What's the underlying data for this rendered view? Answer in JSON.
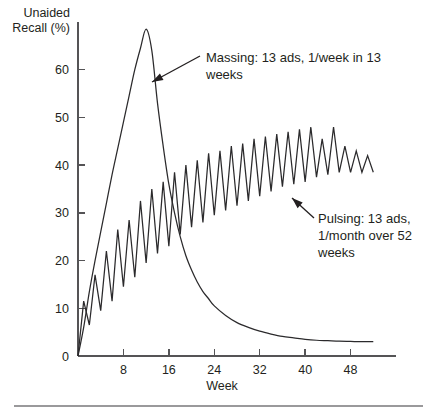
{
  "chart_data": {
    "type": "line",
    "title": "",
    "xlabel": "Week",
    "ylabel": "Unaided Recall (%)",
    "xlim": [
      0,
      56
    ],
    "ylim": [
      0,
      70
    ],
    "xticks": [
      0,
      8,
      16,
      24,
      32,
      40,
      48
    ],
    "xtick_labels": [
      "0",
      "8",
      "16",
      "24",
      "32",
      "40",
      "48"
    ],
    "yticks": [
      0,
      10,
      20,
      30,
      40,
      50,
      60
    ],
    "ytick_labels": [
      "0",
      "10",
      "20",
      "30",
      "40",
      "50",
      "60"
    ],
    "grid": false,
    "legend": "none",
    "series": [
      {
        "name": "Massing: 13 ads, 1/week in 13 weeks",
        "x": [
          0,
          1,
          2,
          3,
          4,
          5,
          6,
          7,
          8,
          9,
          10,
          11,
          12,
          13,
          14,
          15,
          16,
          17,
          18,
          19,
          20,
          21,
          22,
          23,
          24,
          26,
          28,
          30,
          32,
          34,
          36,
          38,
          40,
          42,
          44,
          46,
          48,
          50,
          52
        ],
        "y": [
          0,
          6,
          13.5,
          20,
          26,
          32,
          38,
          43.5,
          49,
          54.5,
          60,
          64.5,
          68.5,
          64,
          53,
          44,
          36,
          30,
          25,
          21,
          18,
          15.5,
          13.5,
          12,
          10.5,
          8.5,
          7,
          6,
          5.2,
          4.6,
          4.1,
          3.8,
          3.5,
          3.3,
          3.2,
          3.1,
          3.05,
          3.0,
          3.0
        ]
      },
      {
        "name": "Pulsing: 13 ads, 1/month over 52 weeks",
        "x": [
          0,
          1,
          2,
          3,
          4,
          5,
          6,
          7,
          8,
          9,
          10,
          11,
          12,
          13,
          14,
          15,
          16,
          17,
          18,
          19,
          20,
          21,
          22,
          23,
          24,
          25,
          26,
          27,
          28,
          29,
          30,
          31,
          32,
          33,
          34,
          35,
          36,
          37,
          38,
          39,
          40,
          41,
          42,
          43,
          44,
          45,
          46,
          47,
          48,
          49,
          50,
          51,
          52
        ],
        "y": [
          0,
          11.5,
          6.5,
          17,
          9.5,
          22,
          11.5,
          26.5,
          14.5,
          28.5,
          16.5,
          32.5,
          19.5,
          35,
          21.5,
          36.5,
          23,
          38.5,
          25.5,
          40,
          27,
          41,
          28,
          42.5,
          29.5,
          43,
          30.5,
          44,
          31.5,
          44.5,
          32.5,
          45.5,
          33.5,
          46,
          34.5,
          46.5,
          35.5,
          47,
          36,
          47.5,
          36.5,
          48,
          37.5,
          45.5,
          38,
          48,
          38.5,
          44,
          38.5,
          43,
          38.5,
          42,
          38.5
        ]
      }
    ],
    "annotations": [
      {
        "id": "massing",
        "text_lines": [
          "Massing: 13 ads, 1/week in 13",
          "weeks"
        ],
        "text_x": 206,
        "text_y": 62,
        "leader_from": [
          200,
          56
        ],
        "leader_to": [
          152,
          82
        ]
      },
      {
        "id": "pulsing",
        "text_lines": [
          "Pulsing: 13 ads,",
          "1/month over 52",
          "weeks"
        ],
        "text_x": 318,
        "text_y": 223,
        "leader_from": [
          314,
          218
        ],
        "leader_to": [
          292,
          198
        ]
      }
    ],
    "colors": {
      "line": "#2b2a2c",
      "axis": "#555456",
      "text": "#231f20",
      "background": "#ffffff",
      "rule": "#9a999b"
    }
  }
}
